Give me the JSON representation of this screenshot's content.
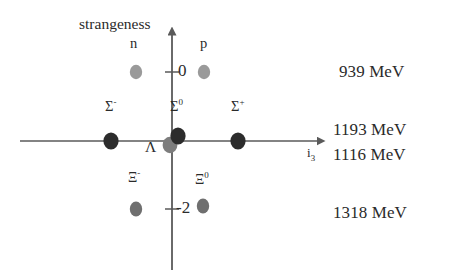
{
  "figure": {
    "type": "scatter",
    "axes": {
      "y_title": "strangeness",
      "x_title": "i",
      "x_title_sub": "3",
      "y_ticks": [
        {
          "label": "0",
          "value": 0
        },
        {
          "label": "-2",
          "value": -2
        }
      ],
      "x_range": [
        -1.6,
        1.6
      ],
      "y_range": [
        -3.4,
        1.0
      ],
      "grid": false
    },
    "points": [
      {
        "name": "n",
        "label": "n",
        "label_sup": "",
        "i3": -0.5,
        "strangeness": 0,
        "color": "#9a9a9a",
        "size": "small"
      },
      {
        "name": "p",
        "label": "p",
        "label_sup": "",
        "i3": 0.5,
        "strangeness": 0,
        "color": "#9a9a9a",
        "size": "small"
      },
      {
        "name": "Sigma-",
        "label": "Σ",
        "label_sup": "-",
        "i3": -1.0,
        "strangeness": -1,
        "color": "#2c2c2c",
        "size": "large"
      },
      {
        "name": "Sigma0",
        "label": "Σ",
        "label_sup": "0",
        "i3": 0.0,
        "strangeness": -1,
        "color": "#2c2c2c",
        "size": "large"
      },
      {
        "name": "Sigma+",
        "label": "Σ",
        "label_sup": "+",
        "i3": 1.0,
        "strangeness": -1,
        "color": "#2c2c2c",
        "size": "large"
      },
      {
        "name": "Lambda",
        "label": "Λ",
        "label_sup": "",
        "i3": 0.0,
        "strangeness": -1,
        "color": "#7d7d7d",
        "size": "large"
      },
      {
        "name": "Xi-",
        "label": "Ξ",
        "label_sup": "-",
        "i3": -0.5,
        "strangeness": -2,
        "color": "#6f6f6f",
        "size": "small"
      },
      {
        "name": "Xi0",
        "label": "Ξ",
        "label_sup": "0",
        "i3": 0.5,
        "strangeness": -2,
        "color": "#6f6f6f",
        "size": "small"
      }
    ],
    "mass_labels": [
      {
        "text": "939 MeV",
        "for": "n, p"
      },
      {
        "text": "1193 MeV",
        "for": "Sigma"
      },
      {
        "text": "1116 MeV",
        "for": "Lambda"
      },
      {
        "text": "1318 MeV",
        "for": "Xi"
      }
    ],
    "colors": {
      "axis": "#5a5a5a",
      "text": "#2b2b2b",
      "dot_dark": "#2c2c2c",
      "dot_mid": "#6f6f6f",
      "dot_light": "#9a9a9a",
      "background": "#ffffff"
    }
  }
}
